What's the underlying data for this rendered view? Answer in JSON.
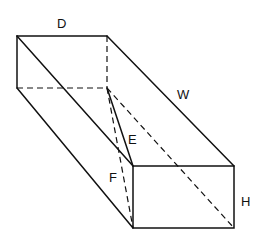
{
  "diagram": {
    "type": "rectangular-box-with-diagonals",
    "labels": {
      "D": "D",
      "W": "W",
      "E": "E",
      "F": "F",
      "H": "H"
    },
    "line_color": "#111111"
  }
}
